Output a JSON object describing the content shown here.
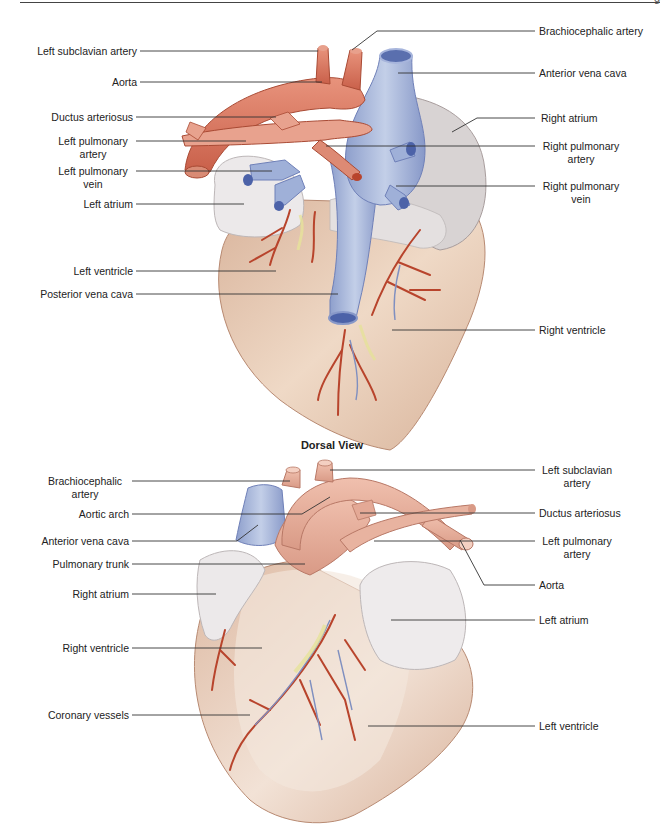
{
  "page": {
    "page_mark": "g"
  },
  "dorsal_view": {
    "caption": "Dorsal View",
    "labels_left": [
      {
        "text": "Left subclavian artery"
      },
      {
        "text": "Aorta"
      },
      {
        "text": "Ductus arteriosus"
      },
      {
        "text": "Left pulmonary\nartery"
      },
      {
        "text": "Left pulmonary\nvein"
      },
      {
        "text": "Left atrium"
      },
      {
        "text": "Left ventricle"
      },
      {
        "text": "Posterior vena cava"
      }
    ],
    "labels_right": [
      {
        "text": "Brachiocephalic artery"
      },
      {
        "text": "Anterior vena cava"
      },
      {
        "text": "Right atrium"
      },
      {
        "text": "Right pulmonary\nartery"
      },
      {
        "text": "Right pulmonary\nvein"
      },
      {
        "text": "Right ventricle"
      }
    ]
  },
  "ventral_view": {
    "labels_left": [
      {
        "text": "Brachiocephalic\nartery"
      },
      {
        "text": "Aortic arch"
      },
      {
        "text": "Anterior vena cava"
      },
      {
        "text": "Pulmonary trunk"
      },
      {
        "text": "Right atrium"
      },
      {
        "text": "Right ventricle"
      },
      {
        "text": "Coronary vessels"
      }
    ],
    "labels_right": [
      {
        "text": "Left subclavian\nartery"
      },
      {
        "text": "Ductus arteriosus"
      },
      {
        "text": "Left pulmonary\nartery"
      },
      {
        "text": "Aorta"
      },
      {
        "text": "Left atrium"
      },
      {
        "text": "Left ventricle"
      }
    ]
  },
  "colors": {
    "artery": "#d9735a",
    "vein": "#9fb0d8",
    "vein_dark": "#5a6fae",
    "atrium": "#ece9ea",
    "ventricle": "#e8cdb8",
    "ventricle_shade": "#c9a08a",
    "vessel_red": "#b8442c",
    "vessel_blue": "#7f8fc0",
    "fat_yellow": "#e6e29a",
    "leader_line": "#333333"
  }
}
